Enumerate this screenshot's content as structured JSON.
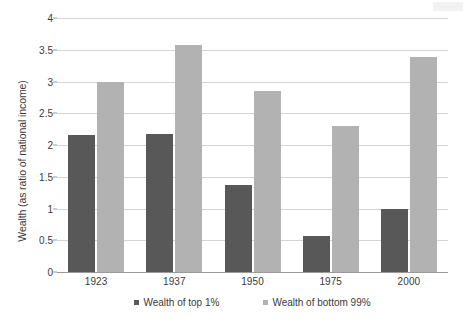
{
  "chart_data": {
    "type": "bar",
    "title": "",
    "subtitle": "",
    "xlabel": "",
    "ylabel": "Wealth (as ratio of national income)",
    "categories": [
      "1923",
      "1937",
      "1950",
      "1975",
      "2000"
    ],
    "series": [
      {
        "name": "Wealth of top 1%",
        "color": "#585858",
        "values": [
          2.15,
          2.17,
          1.37,
          0.57,
          1.0
        ]
      },
      {
        "name": "Wealth of bottom 99%",
        "color": "#b2b2b2",
        "values": [
          3.0,
          3.57,
          2.85,
          2.3,
          3.38
        ]
      }
    ],
    "ylim": [
      0,
      4
    ],
    "yticks": [
      "0",
      "0.5",
      "1",
      "1.5",
      "2",
      "2.5",
      "3",
      "3.5",
      "4"
    ],
    "ytick_values": [
      0,
      0.5,
      1,
      1.5,
      2,
      2.5,
      3,
      3.5,
      4
    ],
    "grid": true,
    "legend_position": "bottom"
  },
  "legend": {
    "items": [
      {
        "label": "Wealth of top 1%",
        "marker": "square-swatch-dark"
      },
      {
        "label": "Wealth of bottom 99%",
        "marker": "square-swatch-light"
      }
    ]
  },
  "colors": {
    "series_top1": "#585858",
    "series_bottom99": "#b2b2b2",
    "gridline": "#d4d4d4",
    "axis": "#9a9a9a",
    "text": "#3a3a3a",
    "background": "#ffffff"
  }
}
